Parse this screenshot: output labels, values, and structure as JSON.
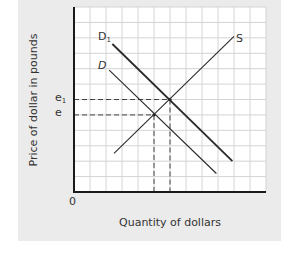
{
  "chart_data": {
    "type": "line",
    "title": "",
    "xlabel": "Quantity of dollars",
    "ylabel": "Price of dollar in pounds",
    "origin_label": "0",
    "y_tick_labels": [
      {
        "label": "e1",
        "base": "e",
        "sub": "1",
        "y_grid": 6
      },
      {
        "label": "e",
        "base": "e",
        "sub": "",
        "y_grid": 5
      }
    ],
    "grid": true,
    "grid_units": {
      "x_max": 12,
      "y_max": 12
    },
    "series": [
      {
        "name": "S",
        "label_base": "S",
        "label_sub": "",
        "points": [
          [
            2.5,
            2.5
          ],
          [
            10,
            10.1
          ]
        ]
      },
      {
        "name": "D",
        "label_base": "D",
        "label_sub": "",
        "points": [
          [
            2.2,
            7.9
          ],
          [
            8.9,
            1.2
          ]
        ]
      },
      {
        "name": "D1",
        "label_base": "D",
        "label_sub": "1",
        "points": [
          [
            2.4,
            9.6
          ],
          [
            9.9,
            2.0
          ]
        ]
      }
    ],
    "equilibria": [
      {
        "name": "original",
        "x": 5,
        "y": 5,
        "price_label": "e"
      },
      {
        "name": "new",
        "x": 6,
        "y": 6,
        "price_label": "e1"
      }
    ],
    "annotations": [
      "Dashed guide lines from equilibria to axes"
    ]
  },
  "colors": {
    "panel_bg": "#ebebeb",
    "plot_bg": "#ffffff",
    "grid": "#d4d4d4",
    "axis": "#1a1a1a",
    "curve": "#2a2a2a",
    "dash": "#444444"
  }
}
